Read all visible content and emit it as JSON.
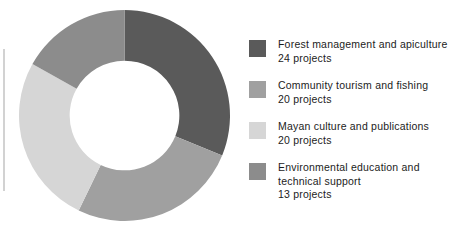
{
  "chart_data": {
    "type": "pie",
    "variant": "donut",
    "title": "",
    "xlabel": "",
    "ylabel": "",
    "total_projects": 77,
    "unit_label": "projects",
    "start_angle_deg": 0,
    "direction": "clockwise",
    "inner_radius_ratio": 0.52,
    "legend_position": "right",
    "grid": false,
    "categories": [
      "Forest management and apiculture",
      "Community tourism and fishing",
      "Mayan culture and publications",
      "Environmental education and technical support"
    ],
    "values": [
      24,
      20,
      20,
      13
    ],
    "value_labels": [
      "24 projects",
      "20 projects",
      "20 projects",
      "13 projects"
    ],
    "colors": [
      "#5a5a5a",
      "#a0a0a0",
      "#d6d6d6",
      "#8c8c8c"
    ],
    "slices": [
      {
        "label": "Forest management and apiculture",
        "value": 24,
        "value_label": "24 projects",
        "color": "#5a5a5a",
        "percent": 31.2,
        "angle_deg": 112.2
      },
      {
        "label": "Community tourism and fishing",
        "value": 20,
        "value_label": "20 projects",
        "color": "#a0a0a0",
        "percent": 26.0,
        "angle_deg": 93.5
      },
      {
        "label": "Mayan culture and publications",
        "value": 20,
        "value_label": "20 projects",
        "color": "#d6d6d6",
        "percent": 26.0,
        "angle_deg": 93.5
      },
      {
        "label": "Environmental education and technical support",
        "value": 13,
        "value_label": "13 projects",
        "color": "#8c8c8c",
        "percent": 16.9,
        "angle_deg": 60.8
      }
    ]
  },
  "legend": {
    "items": [
      {
        "label": "Forest management and apiculture",
        "count": "24 projects",
        "color": "#5a5a5a"
      },
      {
        "label": "Community tourism and fishing",
        "count": "20 projects",
        "color": "#a0a0a0"
      },
      {
        "label": "Mayan culture and publications",
        "count": "20 projects",
        "color": "#d6d6d6"
      },
      {
        "label": "Environmental education and technical support",
        "count": "13 projects",
        "color": "#8c8c8c"
      }
    ],
    "item_3_label_line_1": "Environmental education and",
    "item_3_label_line_2": "technical support"
  }
}
